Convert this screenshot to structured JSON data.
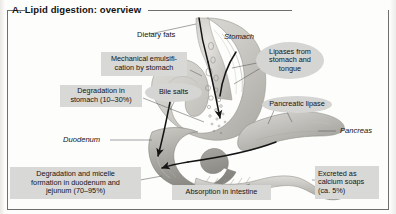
{
  "panel": {
    "letter": "A.",
    "title": "Lipid digestion: overview"
  },
  "labels": {
    "dietary_fats": "Dietary fats",
    "mechanical_emulsification": "Mechanical emulsifi-\ncation by stomach",
    "degradation_stomach": "Degradation in\nstomach (10–30%)",
    "bile_salts": "Bile salts",
    "lipases": "Lipases from\nstomach and\ntongue",
    "pancreatic_lipase": "Pancreatic lipase",
    "degradation_micelle": "Degradation and micelle\nformation in duodenum and\njejunum (70–95%)",
    "absorption": "Absorption in intestine",
    "excreted": "Excreted as\ncalcium soaps\n(ca. 5%)"
  },
  "anatomy": {
    "stomach": "Stomach",
    "duodenum": "Duodenum",
    "pancreas": "Pancreas"
  },
  "colors": {
    "box_fill": "#d8d8d6",
    "ellipse_fill": "#d5d5d3",
    "frame_rule": "#6e6e6e",
    "organ_light": "#d7d6d2",
    "organ_mid": "#b9b7b2",
    "organ_dark": "#8f8d88",
    "flow_arrow": "#1b1b1b",
    "leader_line": "#4a4a4a",
    "text": "#141414"
  },
  "chart_data": {
    "type": "diagram",
    "title": "Lipid digestion: overview",
    "nodes": [
      {
        "id": "dietary_fats",
        "label": "Dietary fats",
        "kind": "plain-label"
      },
      {
        "id": "stomach",
        "label": "Stomach",
        "kind": "anatomy"
      },
      {
        "id": "duodenum",
        "label": "Duodenum",
        "kind": "anatomy"
      },
      {
        "id": "pancreas",
        "label": "Pancreas",
        "kind": "anatomy"
      },
      {
        "id": "mechanical_emulsification",
        "label": "Mechanical emulsification by stomach",
        "kind": "box"
      },
      {
        "id": "degradation_stomach",
        "label": "Degradation in stomach (10-30%)",
        "kind": "box",
        "value_pct": "10-30"
      },
      {
        "id": "bile_salts",
        "label": "Bile salts",
        "kind": "ellipse"
      },
      {
        "id": "lipases",
        "label": "Lipases from stomach and tongue",
        "kind": "ellipse"
      },
      {
        "id": "pancreatic_lipase",
        "label": "Pancreatic lipase",
        "kind": "ellipse"
      },
      {
        "id": "degradation_micelle",
        "label": "Degradation and micelle formation in duodenum and jejunum (70-95%)",
        "kind": "box",
        "value_pct": "70-95"
      },
      {
        "id": "absorption",
        "label": "Absorption in intestine",
        "kind": "box"
      },
      {
        "id": "excreted",
        "label": "Excreted as calcium soaps (ca. 5%)",
        "kind": "box",
        "value_pct": "5"
      }
    ]
  }
}
